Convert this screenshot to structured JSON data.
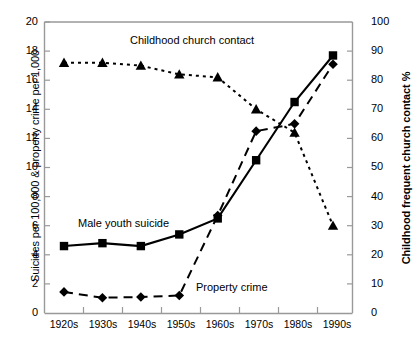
{
  "chart_data": {
    "type": "line",
    "title": "",
    "subtitle": "",
    "xlabel": "",
    "ylabel": "Suicides per 100,000 & property crime per 1,000",
    "ylabel_right": "Childhood frequent church contact %",
    "categories": [
      "1920s",
      "1930s",
      "1940s",
      "1950s",
      "1960s",
      "1970s",
      "1980s",
      "1990s"
    ],
    "ylim": [
      0,
      20
    ],
    "yticks": [
      "0",
      "2",
      "4",
      "6",
      "8",
      "10",
      "12",
      "14",
      "16",
      "18",
      "20"
    ],
    "ylim_right": [
      0,
      100
    ],
    "yticks_right": [
      "0",
      "10",
      "20",
      "30",
      "40",
      "50",
      "60",
      "70",
      "80",
      "90",
      "100"
    ],
    "grid": false,
    "legend": "inline-annotations",
    "series": [
      {
        "name": "Male youth suicide",
        "axis": "left",
        "marker": "square",
        "line_style": "solid",
        "color": "#000000",
        "values": [
          4.6,
          4.8,
          4.6,
          5.4,
          6.5,
          10.5,
          14.5,
          17.7
        ]
      },
      {
        "name": "Property crime",
        "axis": "left",
        "marker": "diamond",
        "line_style": "dashed",
        "color": "#000000",
        "values": [
          1.45,
          1.05,
          1.1,
          1.2,
          6.7,
          12.5,
          13.0,
          17.1
        ]
      },
      {
        "name": "Childhood church contact",
        "axis": "right",
        "marker": "triangle",
        "line_style": "dotted",
        "color": "#000000",
        "values": [
          86,
          86,
          85,
          82,
          81,
          70,
          62,
          30
        ]
      }
    ],
    "annotations": [
      {
        "text": "Childhood church contact",
        "x_px": 130,
        "y_px": 40
      },
      {
        "text": "Male youth suicide",
        "x_px": 78,
        "y_px": 223
      },
      {
        "text": "Property crime",
        "x_px": 196,
        "y_px": 287
      }
    ]
  }
}
